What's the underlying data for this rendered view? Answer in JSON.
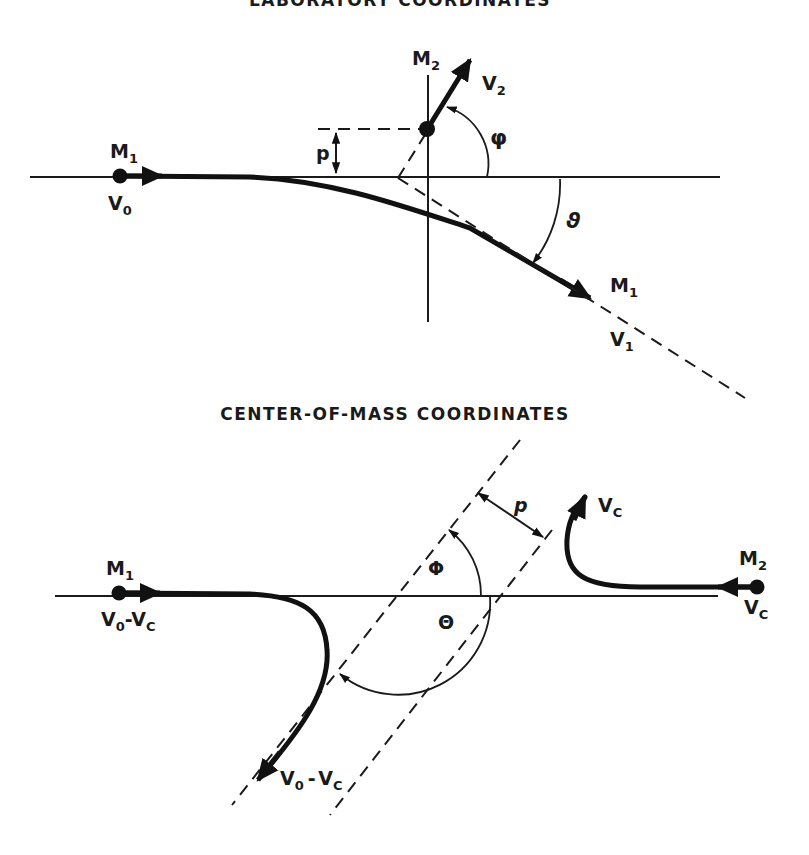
{
  "figure": {
    "top_panel": {
      "title": "LABORATORY COORDINATES",
      "labels": {
        "m1_incoming": {
          "main": "M",
          "sub": "1"
        },
        "v0": {
          "main": "V",
          "sub": "0"
        },
        "m2": {
          "main": "M",
          "sub": "2"
        },
        "v2": {
          "main": "V",
          "sub": "2"
        },
        "impact_parameter": "p",
        "recoil_angle": "φ",
        "scatter_angle": "ϑ",
        "m1_outgoing": {
          "main": "M",
          "sub": "1"
        },
        "v1": {
          "main": "V",
          "sub": "1"
        }
      }
    },
    "bottom_panel": {
      "title": "CENTER-OF-MASS COORDINATES",
      "labels": {
        "m1": {
          "main": "M",
          "sub": "1"
        },
        "v0_minus_vc_in": {
          "a": "V",
          "a_sub": "0",
          "sep": "-",
          "b": "V",
          "b_sub": "C"
        },
        "m2": {
          "main": "M",
          "sub": "2"
        },
        "vc_in": {
          "main": "V",
          "sub": "C"
        },
        "vc_out": {
          "main": "V",
          "sub": "C"
        },
        "impact_parameter": "p",
        "cm_angle_phi": "Φ",
        "cm_angle_theta": "Θ",
        "v0_minus_vc_out": {
          "a": "V",
          "a_sub": "0",
          "sep": "-",
          "b": "V",
          "b_sub": "C"
        }
      }
    },
    "colors": {
      "ink": "#1a1a1a",
      "background": "#ffffff"
    }
  }
}
